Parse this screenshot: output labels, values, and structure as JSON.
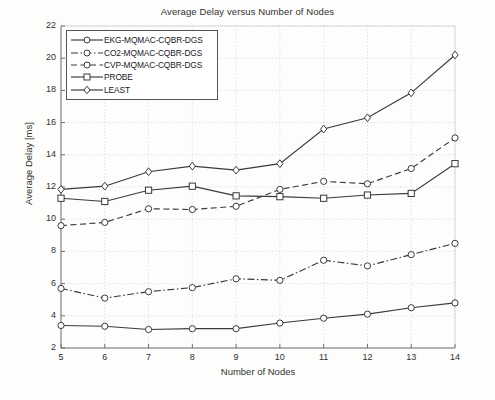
{
  "chart_data": {
    "type": "line",
    "title": "Average Delay versus Number of Nodes",
    "xlabel": "Number of Nodes",
    "ylabel": "Average Delay [ms]",
    "x": [
      5,
      6,
      7,
      8,
      9,
      10,
      11,
      12,
      13,
      14
    ],
    "xlim": [
      5,
      14
    ],
    "ylim": [
      2,
      22
    ],
    "xticks": [
      5,
      6,
      7,
      8,
      9,
      10,
      11,
      12,
      13,
      14
    ],
    "yticks": [
      2,
      4,
      6,
      8,
      10,
      12,
      14,
      16,
      18,
      20,
      22
    ],
    "grid": true,
    "legend_position": "upper left",
    "series": [
      {
        "name": "EKG-MQMAC-CQBR-DGS",
        "values": [
          3.4,
          3.35,
          3.15,
          3.2,
          3.2,
          3.55,
          3.85,
          4.1,
          4.5,
          4.8
        ],
        "linestyle": "solid",
        "marker": "circle",
        "color": "#3a3a3a"
      },
      {
        "name": "CO2-MQMAC-CQBR-DGS",
        "values": [
          5.7,
          5.1,
          5.5,
          5.75,
          6.3,
          6.2,
          7.45,
          7.1,
          7.8,
          8.5
        ],
        "linestyle": "dashdot",
        "marker": "circle",
        "color": "#3a3a3a"
      },
      {
        "name": "CVP-MQMAC-CQBR-DGS",
        "values": [
          9.6,
          9.8,
          10.65,
          10.6,
          10.8,
          11.85,
          12.35,
          12.2,
          13.15,
          15.05
        ],
        "linestyle": "dashed",
        "marker": "circle",
        "color": "#3a3a3a"
      },
      {
        "name": "PROBE",
        "values": [
          11.3,
          11.1,
          11.8,
          12.05,
          11.45,
          11.4,
          11.3,
          11.5,
          11.6,
          13.45
        ],
        "linestyle": "solid",
        "marker": "square",
        "color": "#3a3a3a"
      },
      {
        "name": "LEAST",
        "values": [
          11.85,
          12.05,
          12.95,
          13.3,
          13.05,
          13.45,
          15.6,
          16.3,
          17.85,
          20.2
        ],
        "linestyle": "solid",
        "marker": "diamond",
        "color": "#3a3a3a"
      }
    ]
  }
}
